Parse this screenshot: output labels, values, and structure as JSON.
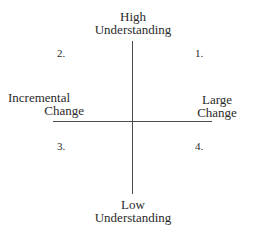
{
  "diagram": {
    "axes": {
      "top": {
        "line1": "High",
        "line2": "Understanding"
      },
      "bottom": {
        "line1": "Low",
        "line2": "Understanding"
      },
      "left": {
        "line1": "Incremental",
        "line2": "Change"
      },
      "right": {
        "line1": "Large",
        "line2": "Change"
      }
    },
    "quadrants": {
      "q1": "1.",
      "q2": "2.",
      "q3": "3.",
      "q4": "4."
    },
    "line_color": "#4a4a4a"
  }
}
